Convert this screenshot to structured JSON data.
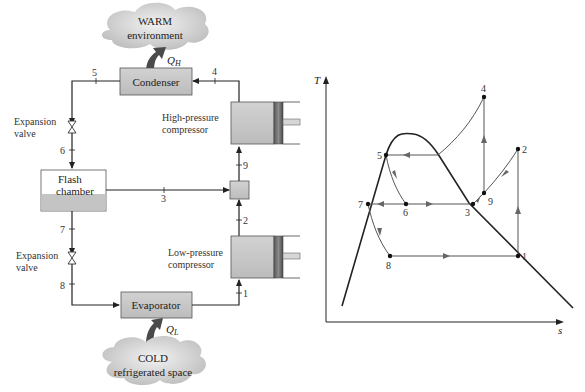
{
  "schematic": {
    "warm_cloud": {
      "line1": "WARM",
      "line2": "environment"
    },
    "cold_cloud": {
      "line1": "COLD",
      "line2": "refrigerated space"
    },
    "heat_out": {
      "symbol": "Q",
      "subscript": "H"
    },
    "heat_in": {
      "symbol": "Q",
      "subscript": "L"
    },
    "components": {
      "condenser": "Condenser",
      "evaporator": "Evaporator",
      "flash_chamber_line1": "Flash",
      "flash_chamber_line2": "chamber",
      "hp_compressor_line1": "High-pressure",
      "hp_compressor_line2": "compressor",
      "lp_compressor_line1": "Low-pressure",
      "lp_compressor_line2": "compressor",
      "upper_valve_line1": "Expansion",
      "upper_valve_line2": "valve",
      "lower_valve_line1": "Expansion",
      "lower_valve_line2": "valve"
    },
    "state_points": [
      "1",
      "2",
      "3",
      "4",
      "5",
      "6",
      "7",
      "8",
      "9"
    ],
    "colors": {
      "component_fill": "#c8c8c8",
      "cloud_fill": "#d4d4d4",
      "heat_arrow": "#4a4a4a",
      "line": "#222222"
    }
  },
  "ts_diagram": {
    "y_axis_label": "T",
    "x_axis_label": "s",
    "points": {
      "p1": "1",
      "p2": "2",
      "p3": "3",
      "p4": "4",
      "p5": "5",
      "p6": "6",
      "p7": "7",
      "p8": "8",
      "p9": "9"
    }
  }
}
